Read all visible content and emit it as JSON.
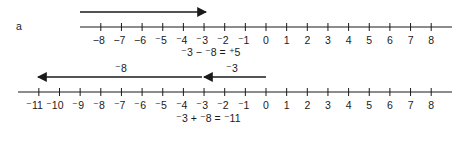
{
  "figure_label": "a",
  "colors": {
    "ink": "#1a1a1a",
    "background": "#ffffff"
  },
  "top_number_line": {
    "range": [
      -8,
      8
    ],
    "tick_labels": [
      "−8",
      "−7",
      "−6",
      "⁻5",
      "⁻4",
      "⁻3",
      "⁻2",
      "⁻1",
      "0",
      "1",
      "2",
      "3",
      "4",
      "5",
      "6",
      "7",
      "8"
    ],
    "arrow": {
      "from": -8,
      "to": -3,
      "direction": "right",
      "start_x_offset": -1
    },
    "equation": {
      "parts": [
        "⁻3",
        " − ",
        "⁻8",
        " = ",
        "⁺5"
      ],
      "text": "⁻3 − ⁻8 = ⁺5"
    }
  },
  "bottom_number_line": {
    "range": [
      -11,
      8
    ],
    "tick_labels": [
      "⁻11",
      "⁻10",
      "⁻9",
      "⁻8",
      "⁻7",
      "⁻6",
      "⁻5",
      "⁻4",
      "⁻3",
      "⁻2",
      "⁻1",
      "0",
      "1",
      "2",
      "3",
      "4",
      "5",
      "6",
      "7",
      "8"
    ],
    "arrows": [
      {
        "label": "⁻3",
        "from": 0,
        "to": -3,
        "direction": "left"
      },
      {
        "label": "⁻8",
        "from": -3,
        "to": -11,
        "direction": "left"
      }
    ],
    "equation": {
      "text": "⁻3 + ⁻8 = ⁻11"
    }
  }
}
